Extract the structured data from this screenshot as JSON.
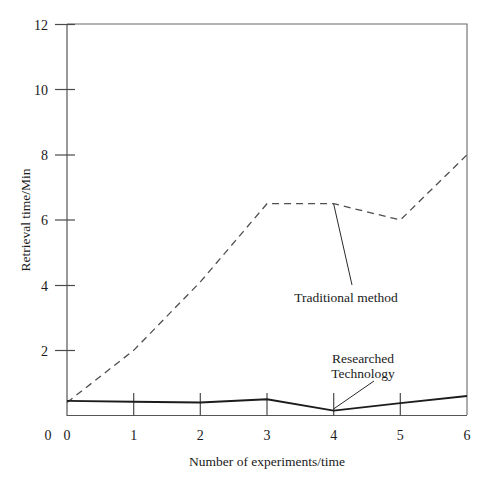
{
  "chart_data": {
    "type": "line",
    "title": "",
    "xlabel": "Number of experiments/time",
    "ylabel": "Retrieval time/Min",
    "x": [
      0,
      1,
      2,
      3,
      4,
      5,
      6
    ],
    "xticklabels": [
      "0",
      "1",
      "2",
      "3",
      "4",
      "5",
      "6"
    ],
    "yticklabels": [
      "0",
      "2",
      "4",
      "6",
      "8",
      "10",
      "12"
    ],
    "yticks": [
      0,
      2,
      4,
      6,
      8,
      10,
      12
    ],
    "xlim": [
      0,
      6
    ],
    "ylim": [
      0,
      12
    ],
    "grid": false,
    "legend_position": "inline-annotation",
    "series": [
      {
        "name": "Traditional method",
        "style": "dashed",
        "color": "#4f4f4f",
        "values": [
          0.4,
          2.0,
          4.1,
          6.5,
          6.5,
          6.0,
          8.0
        ]
      },
      {
        "name": "Researched Technology",
        "style": "solid",
        "color": "#1c1c1c",
        "values": [
          0.45,
          0.42,
          0.4,
          0.5,
          0.15,
          0.38,
          0.6
        ]
      }
    ],
    "annotations": [
      {
        "text": "Traditional method",
        "lines": [
          "Traditional method"
        ],
        "anchor_x": 4.0,
        "anchor_y": 6.5
      },
      {
        "text": "Researched Technology",
        "lines": [
          "Researched",
          "Technology"
        ],
        "anchor_x": 4.0,
        "anchor_y": 0.15
      }
    ]
  },
  "axes": {
    "y_title": "Retrieval time/Min",
    "x_title": "Number of experiments/time",
    "y_tick_labels": [
      "12",
      "10",
      "8",
      "6",
      "4",
      "2",
      "0"
    ],
    "x_tick_labels": [
      "0",
      "1",
      "2",
      "3",
      "4",
      "5",
      "6"
    ]
  },
  "annotations": {
    "traditional": "Traditional method",
    "researched_line1": "Researched",
    "researched_line2": "Technology"
  }
}
